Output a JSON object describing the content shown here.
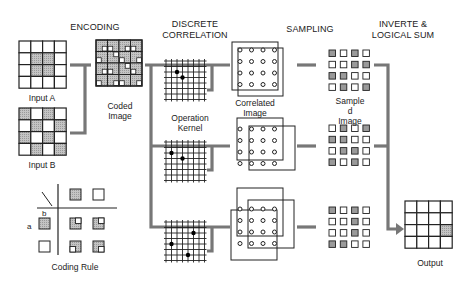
{
  "headers": {
    "encoding": "ENCODING",
    "correlation": "DISCRETE\nCORRELATION",
    "sampling": "SAMPLING",
    "logical_sum": "INVERTE &\nLOGICAL SUM"
  },
  "labels": {
    "input_a": "Input A",
    "input_b": "Input B",
    "coded_image": "Coded\nImage",
    "coding_rule": "Coding Rule",
    "operation_kernel": "Operation\nKernel",
    "correlated_image": "Correlated\nImage",
    "sampled_image": "Sample\nd\nImage",
    "output": "Output",
    "coding_rule_a": "a",
    "coding_rule_b": "b"
  },
  "colors": {
    "shade": "#b8b8b8",
    "line": "#222222",
    "connector": "#777777"
  },
  "grids": {
    "input_a": [
      [
        0,
        0,
        0,
        0
      ],
      [
        0,
        1,
        1,
        0
      ],
      [
        0,
        1,
        1,
        0
      ],
      [
        0,
        0,
        0,
        0
      ]
    ],
    "input_b": [
      [
        1,
        0,
        1,
        0
      ],
      [
        0,
        1,
        0,
        1
      ],
      [
        1,
        0,
        1,
        0
      ],
      [
        0,
        1,
        0,
        1
      ]
    ],
    "output": [
      [
        0,
        0,
        0,
        0
      ],
      [
        0,
        0,
        0,
        0
      ],
      [
        0,
        0,
        0,
        1
      ],
      [
        0,
        0,
        0,
        0
      ]
    ],
    "sampled": [
      [
        [
          1,
          0,
          1,
          0
        ],
        [
          0,
          0,
          1,
          1
        ],
        [
          1,
          1,
          0,
          0
        ],
        [
          0,
          1,
          0,
          1
        ]
      ],
      [
        [
          0,
          1,
          0,
          1
        ],
        [
          1,
          1,
          0,
          0
        ],
        [
          0,
          1,
          1,
          0
        ],
        [
          1,
          0,
          1,
          0
        ]
      ],
      [
        [
          1,
          0,
          1,
          0
        ],
        [
          0,
          0,
          1,
          0
        ],
        [
          0,
          0,
          1,
          0
        ],
        [
          1,
          1,
          0,
          0
        ]
      ]
    ]
  },
  "kernels": [
    {
      "dots": [
        [
          2,
          2
        ],
        [
          3,
          3
        ]
      ]
    },
    {
      "dots": [
        [
          2,
          1
        ],
        [
          3,
          3
        ]
      ]
    },
    {
      "dots": [
        [
          2,
          5
        ],
        [
          4,
          1
        ],
        [
          6,
          4
        ]
      ]
    }
  ]
}
